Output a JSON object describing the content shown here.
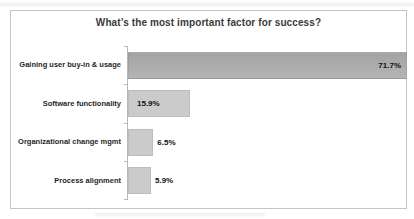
{
  "colors": {
    "background": "#ffffff",
    "chart_border": "#c4c4c4",
    "axis": "#b7b7b7",
    "title_text": "#3a3a3a",
    "label_text": "#1f1f1f",
    "value_text": "#111111",
    "bar_highlight": "#ababab",
    "bar_normal": "#cbcbcb",
    "bar_normal_border": "#bcbcbc"
  },
  "chart_data": {
    "type": "bar",
    "orientation": "horizontal",
    "title": "What’s the most important factor for success?",
    "categories": [
      "Gaining user buy-in & usage",
      "Software functionality",
      "Organizational change mgmt",
      "Process alignment"
    ],
    "values": [
      71.7,
      15.9,
      6.5,
      5.9
    ],
    "value_labels": [
      "71.7%",
      "15.9%",
      "6.5%",
      "5.9%"
    ],
    "unit": "%",
    "xlim": [
      0,
      71.7
    ],
    "grid": false,
    "legend": false,
    "bar_styles": [
      "highlight",
      "normal",
      "normal",
      "normal"
    ],
    "value_label_positions": [
      "inside-end",
      "inside-start",
      "outside-end",
      "outside-end"
    ]
  }
}
